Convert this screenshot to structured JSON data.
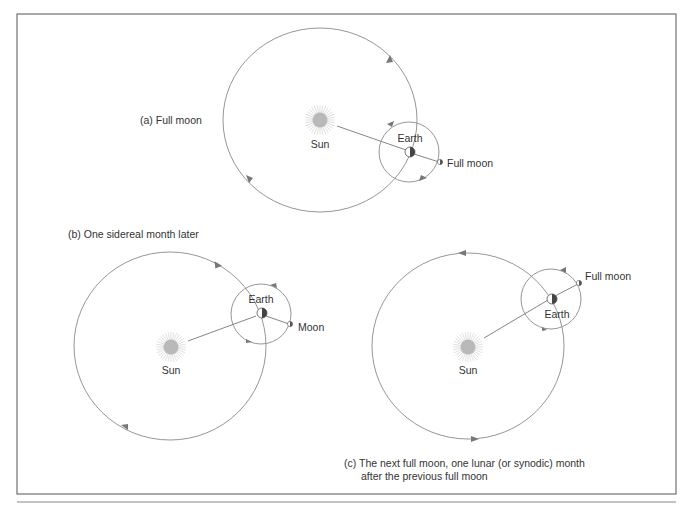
{
  "figure": {
    "frame_color": "#555555",
    "orbit_color": "#8a8a8a",
    "sun_color": "#b9b9b9",
    "sun_ray_color": "#cfcfcf",
    "earth_dark_color": "#4a4a4a",
    "text_color": "#333333"
  },
  "panels": {
    "a": {
      "caption": "(a) Full moon",
      "sun_label": "Sun",
      "earth_label": "Earth",
      "moon_label": "Full moon"
    },
    "b": {
      "caption": "(b) One sidereal month later",
      "sun_label": "Sun",
      "earth_label": "Earth",
      "moon_label": "Moon"
    },
    "c": {
      "caption_line1": "(c) The next full moon, one lunar (or synodic) month",
      "caption_line2": "after the previous full moon",
      "sun_label": "Sun",
      "earth_label": "Earth",
      "moon_label": "Full moon"
    }
  }
}
